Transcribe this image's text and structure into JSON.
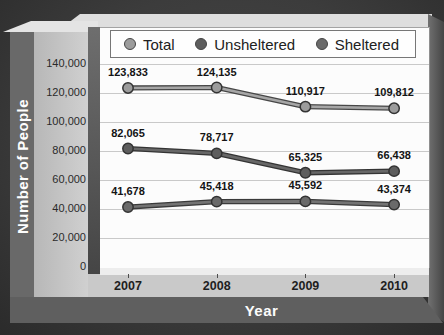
{
  "figure": {
    "y_axis_title": "Number of People",
    "x_axis_title": "Year"
  },
  "chart_data": {
    "type": "line",
    "title": "",
    "xlabel": "Year",
    "ylabel": "Number of People",
    "categories": [
      "2007",
      "2008",
      "2009",
      "2010"
    ],
    "series": [
      {
        "name": "Total",
        "values": [
          123833,
          124135,
          110917,
          109812
        ],
        "point_labels": [
          "123,833",
          "124,135",
          "110,917",
          "109,812"
        ],
        "dot_color": "#9c9c9c",
        "line_color": "#a6a6a6",
        "edge_color": "#474747"
      },
      {
        "name": "Unsheltered",
        "values": [
          82065,
          78717,
          65325,
          66438
        ],
        "point_labels": [
          "82,065",
          "78,717",
          "65,325",
          "66,438"
        ],
        "dot_color": "#5d5d5d",
        "line_color": "#676767",
        "edge_color": "#343434"
      },
      {
        "name": "Sheltered",
        "values": [
          41678,
          45418,
          45592,
          43374
        ],
        "point_labels": [
          "41,678",
          "45,418",
          "45,592",
          "43,374"
        ],
        "dot_color": "#6a6a6a",
        "line_color": "#737373",
        "edge_color": "#3a3a3a"
      }
    ],
    "ylim": [
      0,
      140000
    ],
    "ytick_interval": 20000,
    "ytick_labels": [
      "0",
      "20,000",
      "40,000",
      "60,000",
      "80,000",
      "100,000",
      "120,000",
      "140,000"
    ],
    "grid": true,
    "gridline_color": "#c9c9c9",
    "legend_position": "top",
    "label_color": "#141414"
  }
}
